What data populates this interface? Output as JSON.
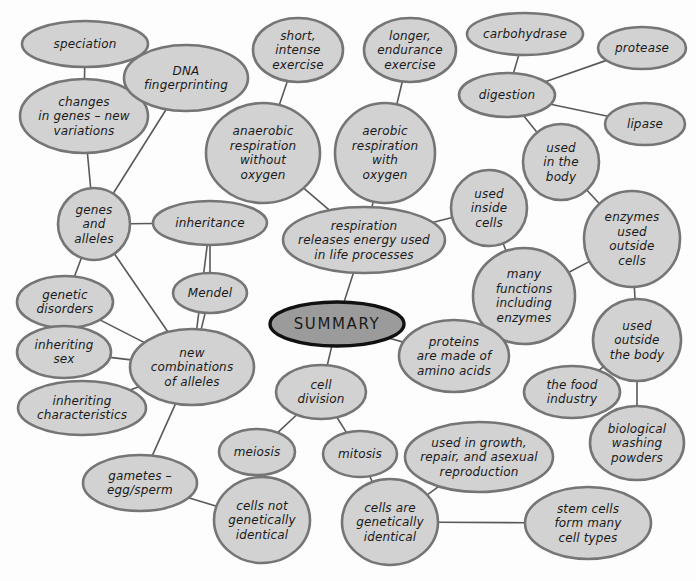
{
  "diagram": {
    "kind": "mind-map",
    "title": "SUMMARY",
    "background_color": "#fdfdfd",
    "node_fill": "#d2d2d2",
    "node_stroke": "#757575",
    "center_fill": "#9b9b9b",
    "center_stroke": "#111111",
    "edge_color": "#595959",
    "nodes": [
      {
        "id": "summary",
        "label": "SUMMARY",
        "lines": [
          "SUMMARY"
        ],
        "cx": 337,
        "cy": 324,
        "rx": 67,
        "ry": 22,
        "center": true
      },
      {
        "id": "speciation",
        "label": "speciation",
        "lines": [
          "speciation"
        ],
        "cx": 85,
        "cy": 44,
        "rx": 63,
        "ry": 23
      },
      {
        "id": "changes_genes",
        "label": "changes in genes – new variations",
        "lines": [
          "changes",
          "in genes – new",
          "variations"
        ],
        "cx": 84,
        "cy": 116,
        "rx": 64,
        "ry": 37
      },
      {
        "id": "dna_fingerprinting",
        "label": "DNA fingerprinting",
        "lines": [
          "DNA",
          "fingerprinting"
        ],
        "cx": 186,
        "cy": 78,
        "rx": 62,
        "ry": 33
      },
      {
        "id": "genes_alleles",
        "label": "genes and alleles",
        "lines": [
          "genes",
          "and",
          "alleles"
        ],
        "cx": 94,
        "cy": 224,
        "rx": 36,
        "ry": 36
      },
      {
        "id": "inheritance",
        "label": "inheritance",
        "lines": [
          "inheritance"
        ],
        "cx": 210,
        "cy": 223,
        "rx": 57,
        "ry": 22
      },
      {
        "id": "mendel",
        "label": "Mendel",
        "lines": [
          "Mendel"
        ],
        "cx": 210,
        "cy": 293,
        "rx": 37,
        "ry": 20
      },
      {
        "id": "genetic_disorders",
        "label": "genetic disorders",
        "lines": [
          "genetic",
          "disorders"
        ],
        "cx": 65,
        "cy": 302,
        "rx": 48,
        "ry": 26
      },
      {
        "id": "inheriting_sex",
        "label": "inheriting sex",
        "lines": [
          "inheriting",
          "sex"
        ],
        "cx": 64,
        "cy": 352,
        "rx": 47,
        "ry": 26
      },
      {
        "id": "inheriting_chars",
        "label": "inheriting characteristics",
        "lines": [
          "inheriting",
          "characteristics"
        ],
        "cx": 82,
        "cy": 408,
        "rx": 64,
        "ry": 27
      },
      {
        "id": "new_combinations",
        "label": "new combinations of alleles",
        "lines": [
          "new",
          "combinations",
          "of alleles"
        ],
        "cx": 192,
        "cy": 367,
        "rx": 62,
        "ry": 38
      },
      {
        "id": "gametes",
        "label": "gametes – egg/sperm",
        "lines": [
          "gametes –",
          "egg/sperm"
        ],
        "cx": 140,
        "cy": 483,
        "rx": 57,
        "ry": 28
      },
      {
        "id": "short_exercise",
        "label": "short, intense exercise",
        "lines": [
          "short,",
          "intense",
          "exercise"
        ],
        "cx": 298,
        "cy": 50,
        "rx": 45,
        "ry": 32
      },
      {
        "id": "longer_exercise",
        "label": "longer, endurance exercise",
        "lines": [
          "longer,",
          "endurance",
          "exercise"
        ],
        "cx": 410,
        "cy": 50,
        "rx": 46,
        "ry": 32
      },
      {
        "id": "anaerobic",
        "label": "anaerobic respiration without oxygen",
        "lines": [
          "anaerobic",
          "respiration",
          "without",
          "oxygen"
        ],
        "cx": 263,
        "cy": 153,
        "rx": 57,
        "ry": 50
      },
      {
        "id": "aerobic",
        "label": "aerobic respiration with oxygen",
        "lines": [
          "aerobic",
          "respiration",
          "with",
          "oxygen"
        ],
        "cx": 385,
        "cy": 153,
        "rx": 50,
        "ry": 50
      },
      {
        "id": "respiration",
        "label": "respiration releases energy used in life processes",
        "lines": [
          "respiration",
          "releases energy used",
          "in life processes"
        ],
        "cx": 364,
        "cy": 240,
        "rx": 81,
        "ry": 33
      },
      {
        "id": "used_inside_cells",
        "label": "used inside cells",
        "lines": [
          "used",
          "inside",
          "cells"
        ],
        "cx": 489,
        "cy": 208,
        "rx": 38,
        "ry": 38
      },
      {
        "id": "carbohydrase",
        "label": "carbohydrase",
        "lines": [
          "carbohydrase"
        ],
        "cx": 525,
        "cy": 34,
        "rx": 58,
        "ry": 21
      },
      {
        "id": "digestion",
        "label": "digestion",
        "lines": [
          "digestion"
        ],
        "cx": 507,
        "cy": 95,
        "rx": 48,
        "ry": 22
      },
      {
        "id": "protease",
        "label": "protease",
        "lines": [
          "protease"
        ],
        "cx": 642,
        "cy": 48,
        "rx": 44,
        "ry": 21
      },
      {
        "id": "lipase",
        "label": "lipase",
        "lines": [
          "lipase"
        ],
        "cx": 645,
        "cy": 124,
        "rx": 40,
        "ry": 21
      },
      {
        "id": "used_in_body",
        "label": "used in the body",
        "lines": [
          "used",
          "in the",
          "body"
        ],
        "cx": 561,
        "cy": 162,
        "rx": 38,
        "ry": 38
      },
      {
        "id": "enzymes_outside",
        "label": "enzymes used outside cells",
        "lines": [
          "enzymes",
          "used",
          "outside",
          "cells"
        ],
        "cx": 632,
        "cy": 239,
        "rx": 48,
        "ry": 48
      },
      {
        "id": "many_functions",
        "label": "many functions including enzymes",
        "lines": [
          "many",
          "functions",
          "including",
          "enzymes"
        ],
        "cx": 524,
        "cy": 296,
        "rx": 51,
        "ry": 48
      },
      {
        "id": "used_outside_body",
        "label": "used outside the body",
        "lines": [
          "used",
          "outside",
          "the body"
        ],
        "cx": 637,
        "cy": 340,
        "rx": 44,
        "ry": 41
      },
      {
        "id": "food_industry",
        "label": "the food industry",
        "lines": [
          "the food",
          "industry"
        ],
        "cx": 572,
        "cy": 392,
        "rx": 48,
        "ry": 26
      },
      {
        "id": "washing_powders",
        "label": "biological washing powders",
        "lines": [
          "biological",
          "washing",
          "powders"
        ],
        "cx": 637,
        "cy": 443,
        "rx": 47,
        "ry": 37
      },
      {
        "id": "proteins",
        "label": "proteins are made of amino acids",
        "lines": [
          "proteins",
          "are made of",
          "amino acids"
        ],
        "cx": 454,
        "cy": 356,
        "rx": 55,
        "ry": 36
      },
      {
        "id": "cell_division",
        "label": "cell division",
        "lines": [
          "cell",
          "division"
        ],
        "cx": 321,
        "cy": 392,
        "rx": 45,
        "ry": 27
      },
      {
        "id": "meiosis",
        "label": "meiosis",
        "lines": [
          "meiosis"
        ],
        "cx": 257,
        "cy": 452,
        "rx": 38,
        "ry": 23
      },
      {
        "id": "mitosis",
        "label": "mitosis",
        "lines": [
          "mitosis"
        ],
        "cx": 360,
        "cy": 454,
        "rx": 37,
        "ry": 23
      },
      {
        "id": "cells_not_identical",
        "label": "cells not genetically identical",
        "lines": [
          "cells not",
          "genetically",
          "identical"
        ],
        "cx": 262,
        "cy": 520,
        "rx": 48,
        "ry": 43
      },
      {
        "id": "cells_identical",
        "label": "cells are genetically identical",
        "lines": [
          "cells are",
          "genetically",
          "identical"
        ],
        "cx": 390,
        "cy": 522,
        "rx": 48,
        "ry": 43
      },
      {
        "id": "growth_repair",
        "label": "used in growth, repair, and asexual reproduction",
        "lines": [
          "used in growth,",
          "repair, and asexual",
          "reproduction"
        ],
        "cx": 479,
        "cy": 457,
        "rx": 74,
        "ry": 35
      },
      {
        "id": "stem_cells",
        "label": "stem cells form many cell types",
        "lines": [
          "stem cells",
          "form many",
          "cell types"
        ],
        "cx": 588,
        "cy": 523,
        "rx": 63,
        "ry": 36
      }
    ],
    "edges": [
      {
        "from": "speciation",
        "to": "changes_genes"
      },
      {
        "from": "changes_genes",
        "to": "genes_alleles"
      },
      {
        "from": "dna_fingerprinting",
        "to": "genes_alleles"
      },
      {
        "from": "genes_alleles",
        "to": "inheritance"
      },
      {
        "from": "genes_alleles",
        "to": "genetic_disorders"
      },
      {
        "from": "genes_alleles",
        "to": "new_combinations"
      },
      {
        "from": "inheritance",
        "to": "mendel"
      },
      {
        "from": "inheritance",
        "to": "new_combinations"
      },
      {
        "from": "mendel",
        "to": "new_combinations"
      },
      {
        "from": "genetic_disorders",
        "to": "new_combinations"
      },
      {
        "from": "inheriting_sex",
        "to": "new_combinations"
      },
      {
        "from": "inheriting_chars",
        "to": "new_combinations"
      },
      {
        "from": "new_combinations",
        "to": "gametes"
      },
      {
        "from": "gametes",
        "to": "cells_not_identical"
      },
      {
        "from": "short_exercise",
        "to": "anaerobic"
      },
      {
        "from": "longer_exercise",
        "to": "aerobic"
      },
      {
        "from": "anaerobic",
        "to": "respiration"
      },
      {
        "from": "aerobic",
        "to": "respiration"
      },
      {
        "from": "respiration",
        "to": "used_inside_cells"
      },
      {
        "from": "respiration",
        "to": "summary"
      },
      {
        "from": "carbohydrase",
        "to": "digestion"
      },
      {
        "from": "digestion",
        "to": "protease"
      },
      {
        "from": "digestion",
        "to": "lipase"
      },
      {
        "from": "digestion",
        "to": "used_in_body"
      },
      {
        "from": "used_in_body",
        "to": "enzymes_outside"
      },
      {
        "from": "used_inside_cells",
        "to": "many_functions"
      },
      {
        "from": "many_functions",
        "to": "enzymes_outside"
      },
      {
        "from": "enzymes_outside",
        "to": "used_outside_body"
      },
      {
        "from": "used_outside_body",
        "to": "food_industry"
      },
      {
        "from": "used_outside_body",
        "to": "washing_powders"
      },
      {
        "from": "many_functions",
        "to": "proteins"
      },
      {
        "from": "proteins",
        "to": "summary"
      },
      {
        "from": "summary",
        "to": "cell_division"
      },
      {
        "from": "cell_division",
        "to": "meiosis"
      },
      {
        "from": "cell_division",
        "to": "mitosis"
      },
      {
        "from": "meiosis",
        "to": "cells_not_identical"
      },
      {
        "from": "mitosis",
        "to": "cells_identical"
      },
      {
        "from": "cells_identical",
        "to": "growth_repair"
      },
      {
        "from": "cells_identical",
        "to": "stem_cells"
      }
    ]
  }
}
